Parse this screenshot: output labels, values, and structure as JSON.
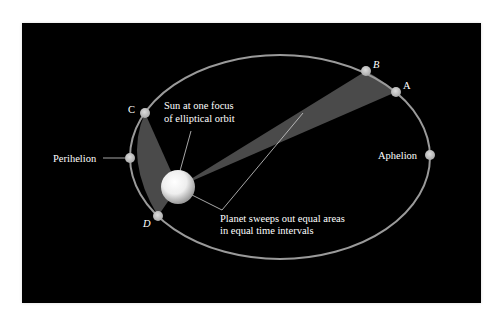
{
  "diagram": {
    "colors": {
      "background": "#000000",
      "page": "#ffffff",
      "orbit": "#9a9a9a",
      "wedge": "#4a4a4a",
      "planet": "#c8c8c8",
      "sun": "#f2f2f2",
      "text": "#ffffff",
      "leader": "#d0d0d0"
    },
    "labels": {
      "sun_line1": "Sun at one focus",
      "sun_line2": "of elliptical orbit",
      "perihelion": "Perihelion",
      "aphelion": "Aphelion",
      "point_a": "A",
      "point_b": "B",
      "point_c": "C",
      "point_d": "D",
      "sweep_line1": "Planet sweeps out equal areas",
      "sweep_line2": "in equal time intervals"
    }
  }
}
